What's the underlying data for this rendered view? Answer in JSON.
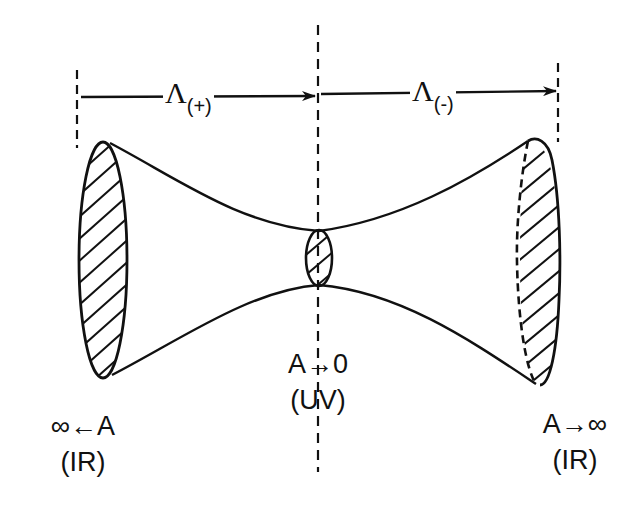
{
  "diagram": {
    "type": "hyperboloid / flux-tube geometry with UV neck and IR ends",
    "dimensions": {
      "left_span": {
        "symbol": "Λ",
        "subscript": "(+)"
      },
      "right_span": {
        "symbol": "Λ",
        "subscript": "(-)"
      }
    },
    "labels": {
      "left": {
        "line1": "∞←A",
        "line2": "(IR)"
      },
      "center": {
        "line1": "A→0",
        "line2": "(UV)"
      },
      "right": {
        "line1": "A→∞",
        "line2": "(IR)"
      }
    },
    "colors": {
      "ink": "#111111",
      "background": "#ffffff"
    }
  }
}
